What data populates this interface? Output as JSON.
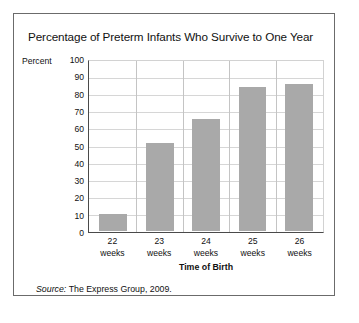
{
  "figure": {
    "title": "Percentage of Preterm Infants Who Survive to One Year",
    "source_label": "Source:",
    "source_text": "The Express Group, 2009.",
    "border_color": "#6b6b6b",
    "background": "#ffffff"
  },
  "chart_data": {
    "type": "bar",
    "title": "Percentage of Preterm Infants Who Survive to One Year",
    "categories": [
      "22 weeks",
      "23 weeks",
      "24 weeks",
      "25 weeks",
      "26 weeks"
    ],
    "category_lines": [
      [
        "22",
        "weeks"
      ],
      [
        "23",
        "weeks"
      ],
      [
        "24",
        "weeks"
      ],
      [
        "25",
        "weeks"
      ],
      [
        "26",
        "weeks"
      ]
    ],
    "values": [
      10,
      52,
      66,
      85,
      87
    ],
    "xlabel": "Time of Birth",
    "ylabel": "Percent",
    "ylim": [
      0,
      100
    ],
    "ytick_labels": [
      "100",
      "90",
      "80",
      "70",
      "60",
      "50",
      "40",
      "30",
      "20",
      "10",
      "0"
    ],
    "ytick_values": [
      100,
      90,
      80,
      70,
      60,
      50,
      40,
      30,
      20,
      10,
      0
    ],
    "grid": "horizontal",
    "legend": "none",
    "bar_color": "#a9a9a9",
    "gridline_color": "#d6d6d6",
    "axis_color": "#4a4a4a"
  }
}
